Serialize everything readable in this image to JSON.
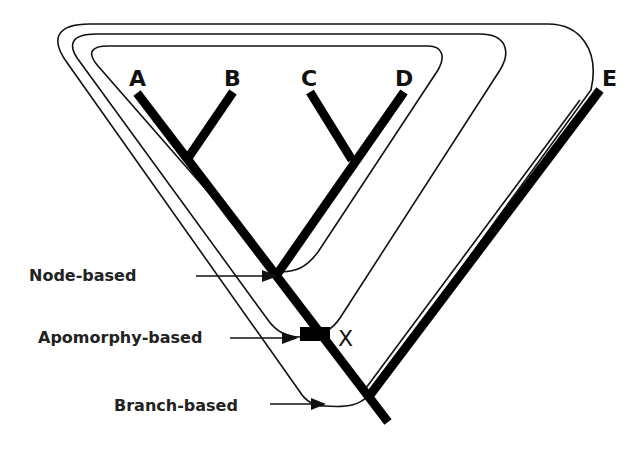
{
  "diagram": {
    "type": "cladogram",
    "taxa": [
      {
        "id": "A",
        "label": "A"
      },
      {
        "id": "B",
        "label": "B"
      },
      {
        "id": "C",
        "label": "C"
      },
      {
        "id": "D",
        "label": "D"
      },
      {
        "id": "E",
        "label": "E"
      }
    ],
    "apomorphy_marker": {
      "label": "X"
    },
    "definitions": [
      {
        "id": "node",
        "label": "Node-based"
      },
      {
        "id": "apomorphy",
        "label": "Apomorphy-based"
      },
      {
        "id": "branch",
        "label": "Branch-based"
      }
    ],
    "colors": {
      "ink": "#000000",
      "background": "#ffffff"
    }
  }
}
